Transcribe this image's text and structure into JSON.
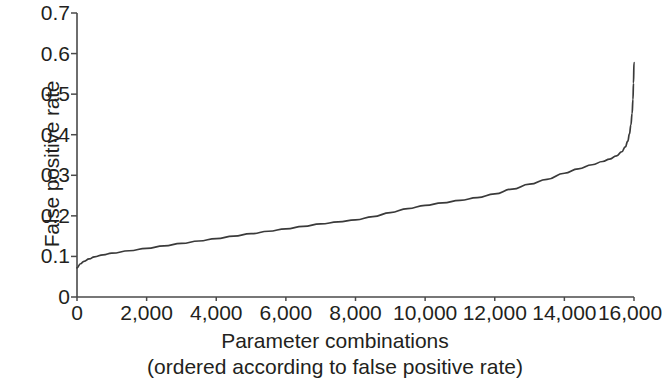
{
  "chart_data": {
    "type": "line",
    "title": "",
    "xlabel": "Parameter combinations",
    "xlabel_line2": "(ordered according to false positive rate)",
    "ylabel": "False positive rate",
    "xlim": [
      0,
      16000
    ],
    "ylim": [
      0,
      0.7
    ],
    "grid": false,
    "legend": null,
    "line_color": "#3a3a3a",
    "xticks": [
      0,
      2000,
      4000,
      6000,
      8000,
      10000,
      12000,
      14000,
      16000
    ],
    "xtick_labels": [
      "0",
      "2,000",
      "4,000",
      "6,000",
      "8,000",
      "10,000",
      "12,000",
      "14,000",
      "16,000"
    ],
    "yticks": [
      0,
      0.1,
      0.2,
      0.3,
      0.4,
      0.5,
      0.6,
      0.7
    ],
    "ytick_labels": [
      "0",
      "0.1",
      "0.2",
      "0.3",
      "0.4",
      "0.5",
      "0.6",
      "0.7"
    ],
    "series": [
      {
        "name": "false positive rate",
        "x": [
          0,
          100,
          200,
          350,
          500,
          750,
          1000,
          1500,
          2000,
          2500,
          3000,
          3500,
          4000,
          4500,
          5000,
          5500,
          6000,
          6500,
          7000,
          7500,
          8000,
          8500,
          9000,
          9500,
          10000,
          10500,
          11000,
          11500,
          12000,
          12500,
          13000,
          13500,
          14000,
          14400,
          14800,
          15100,
          15300,
          15500,
          15650,
          15750,
          15820,
          15870,
          15910,
          15945,
          15970,
          15985,
          16000
        ],
        "y": [
          0.072,
          0.082,
          0.088,
          0.094,
          0.099,
          0.104,
          0.108,
          0.114,
          0.12,
          0.126,
          0.132,
          0.138,
          0.144,
          0.15,
          0.156,
          0.162,
          0.168,
          0.174,
          0.18,
          0.185,
          0.19,
          0.198,
          0.208,
          0.218,
          0.226,
          0.232,
          0.238,
          0.245,
          0.254,
          0.266,
          0.278,
          0.29,
          0.305,
          0.316,
          0.326,
          0.334,
          0.34,
          0.348,
          0.358,
          0.37,
          0.384,
          0.402,
          0.424,
          0.452,
          0.487,
          0.527,
          0.578
        ]
      }
    ]
  },
  "axes_geometry": {
    "note": "pixel mapping used for rendering",
    "x0_px": 77,
    "x1_px": 634,
    "y0_px": 297,
    "y1_px": 13
  }
}
